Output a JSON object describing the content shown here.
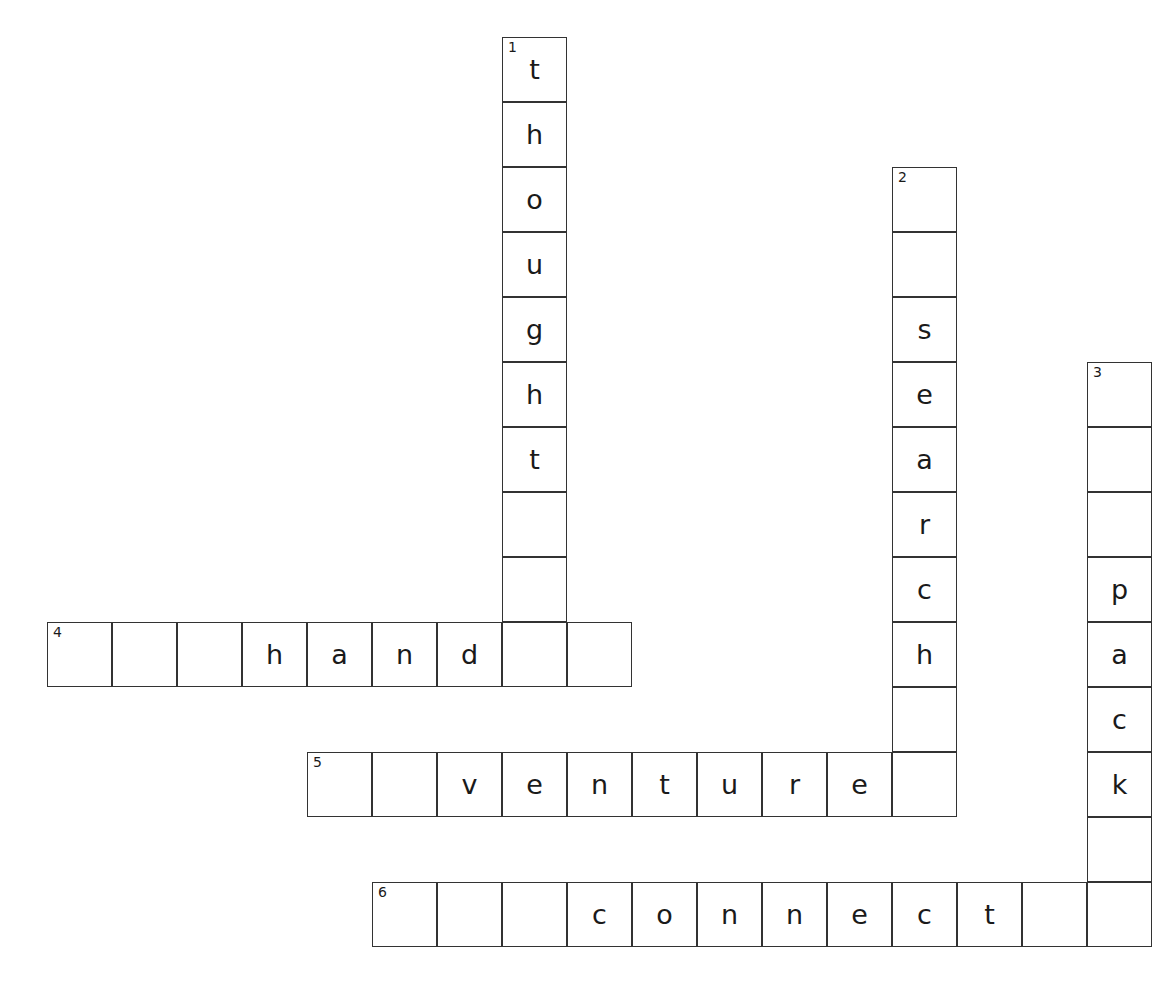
{
  "puzzle": {
    "title": "Crossword Puzzle",
    "cell_size": 65,
    "origin_x": 47,
    "origin_y": 37,
    "grid_columns": 17,
    "grid_rows": 14,
    "background_color": "#ffffff",
    "border_color": "#333333",
    "letter_color": "#1a1a1a",
    "entries": [
      {
        "number": "1",
        "direction": "down",
        "answer": "thought",
        "length": 9,
        "start_col": 7,
        "start_row": 0,
        "cells": [
          {
            "col": 7,
            "row": 0,
            "letter": "t",
            "number": "1"
          },
          {
            "col": 7,
            "row": 1,
            "letter": "h",
            "number": ""
          },
          {
            "col": 7,
            "row": 2,
            "letter": "o",
            "number": ""
          },
          {
            "col": 7,
            "row": 3,
            "letter": "u",
            "number": ""
          },
          {
            "col": 7,
            "row": 4,
            "letter": "g",
            "number": ""
          },
          {
            "col": 7,
            "row": 5,
            "letter": "h",
            "number": ""
          },
          {
            "col": 7,
            "row": 6,
            "letter": "t",
            "number": ""
          },
          {
            "col": 7,
            "row": 7,
            "letter": "",
            "number": ""
          },
          {
            "col": 7,
            "row": 8,
            "letter": "",
            "number": ""
          }
        ]
      },
      {
        "number": "2",
        "direction": "down",
        "answer": "search",
        "length": 9,
        "start_col": 13,
        "start_row": 2,
        "cells": [
          {
            "col": 13,
            "row": 2,
            "letter": "",
            "number": "2"
          },
          {
            "col": 13,
            "row": 3,
            "letter": "",
            "number": ""
          },
          {
            "col": 13,
            "row": 4,
            "letter": "s",
            "number": ""
          },
          {
            "col": 13,
            "row": 5,
            "letter": "e",
            "number": ""
          },
          {
            "col": 13,
            "row": 6,
            "letter": "a",
            "number": ""
          },
          {
            "col": 13,
            "row": 7,
            "letter": "r",
            "number": ""
          },
          {
            "col": 13,
            "row": 8,
            "letter": "c",
            "number": ""
          },
          {
            "col": 13,
            "row": 9,
            "letter": "h",
            "number": ""
          },
          {
            "col": 13,
            "row": 10,
            "letter": "",
            "number": ""
          }
        ]
      },
      {
        "number": "3",
        "direction": "down",
        "answer": "pack",
        "length": 9,
        "start_col": 16,
        "start_row": 5,
        "cells": [
          {
            "col": 16,
            "row": 5,
            "letter": "",
            "number": "3"
          },
          {
            "col": 16,
            "row": 6,
            "letter": "",
            "number": ""
          },
          {
            "col": 16,
            "row": 7,
            "letter": "",
            "number": ""
          },
          {
            "col": 16,
            "row": 8,
            "letter": "p",
            "number": ""
          },
          {
            "col": 16,
            "row": 9,
            "letter": "a",
            "number": ""
          },
          {
            "col": 16,
            "row": 10,
            "letter": "c",
            "number": ""
          },
          {
            "col": 16,
            "row": 11,
            "letter": "k",
            "number": ""
          },
          {
            "col": 16,
            "row": 12,
            "letter": "",
            "number": ""
          }
        ]
      },
      {
        "number": "4",
        "direction": "across",
        "answer": "hand",
        "length": 9,
        "start_col": 0,
        "start_row": 9,
        "cells": [
          {
            "col": 0,
            "row": 9,
            "letter": "",
            "number": "4"
          },
          {
            "col": 1,
            "row": 9,
            "letter": "",
            "number": ""
          },
          {
            "col": 2,
            "row": 9,
            "letter": "",
            "number": ""
          },
          {
            "col": 3,
            "row": 9,
            "letter": "h",
            "number": ""
          },
          {
            "col": 4,
            "row": 9,
            "letter": "a",
            "number": ""
          },
          {
            "col": 5,
            "row": 9,
            "letter": "n",
            "number": ""
          },
          {
            "col": 6,
            "row": 9,
            "letter": "d",
            "number": ""
          },
          {
            "col": 7,
            "row": 9,
            "letter": "",
            "number": ""
          },
          {
            "col": 8,
            "row": 9,
            "letter": "",
            "number": ""
          }
        ]
      },
      {
        "number": "5",
        "direction": "across",
        "answer": "venture",
        "length": 10,
        "start_col": 4,
        "start_row": 11,
        "cells": [
          {
            "col": 4,
            "row": 11,
            "letter": "",
            "number": "5"
          },
          {
            "col": 5,
            "row": 11,
            "letter": "",
            "number": ""
          },
          {
            "col": 6,
            "row": 11,
            "letter": "v",
            "number": ""
          },
          {
            "col": 7,
            "row": 11,
            "letter": "e",
            "number": ""
          },
          {
            "col": 8,
            "row": 11,
            "letter": "n",
            "number": ""
          },
          {
            "col": 9,
            "row": 11,
            "letter": "t",
            "number": ""
          },
          {
            "col": 10,
            "row": 11,
            "letter": "u",
            "number": ""
          },
          {
            "col": 11,
            "row": 11,
            "letter": "r",
            "number": ""
          },
          {
            "col": 12,
            "row": 11,
            "letter": "e",
            "number": ""
          },
          {
            "col": 13,
            "row": 11,
            "letter": "",
            "number": ""
          }
        ]
      },
      {
        "number": "6",
        "direction": "across",
        "answer": "connect",
        "length": 12,
        "start_col": 5,
        "start_row": 13,
        "cells": [
          {
            "col": 5,
            "row": 13,
            "letter": "",
            "number": "6"
          },
          {
            "col": 6,
            "row": 13,
            "letter": "",
            "number": ""
          },
          {
            "col": 7,
            "row": 13,
            "letter": "",
            "number": ""
          },
          {
            "col": 8,
            "row": 13,
            "letter": "c",
            "number": ""
          },
          {
            "col": 9,
            "row": 13,
            "letter": "o",
            "number": ""
          },
          {
            "col": 10,
            "row": 13,
            "letter": "n",
            "number": ""
          },
          {
            "col": 11,
            "row": 13,
            "letter": "n",
            "number": ""
          },
          {
            "col": 12,
            "row": 13,
            "letter": "e",
            "number": ""
          },
          {
            "col": 13,
            "row": 13,
            "letter": "c",
            "number": ""
          },
          {
            "col": 14,
            "row": 13,
            "letter": "t",
            "number": ""
          },
          {
            "col": 15,
            "row": 13,
            "letter": "",
            "number": ""
          },
          {
            "col": 16,
            "row": 13,
            "letter": "",
            "number": ""
          }
        ]
      }
    ]
  }
}
